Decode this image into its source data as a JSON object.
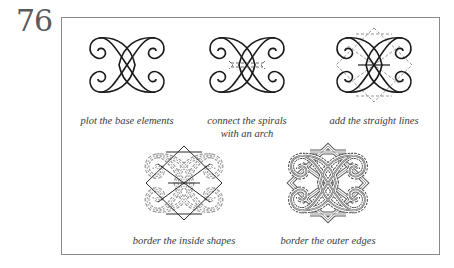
{
  "page_number": "76",
  "figures": [
    {
      "id": "step-1",
      "caption": "plot the base elements"
    },
    {
      "id": "step-2",
      "caption_line1": "connect the spirals",
      "caption_line2": "with an arch"
    },
    {
      "id": "step-3",
      "caption": "add the straight lines"
    },
    {
      "id": "step-4",
      "caption": "border the inside shapes"
    },
    {
      "id": "step-5",
      "caption": "border the outer edges"
    }
  ],
  "colors": {
    "line": "#1a1a1a",
    "dashed": "#8a8a8a",
    "frame": "#8a8a8a",
    "text": "#3a3a3a",
    "page_number": "#5a5a5a"
  }
}
